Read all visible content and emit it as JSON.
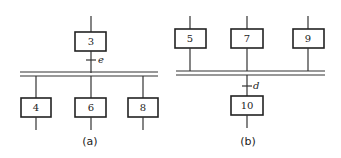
{
  "diagram_a": {
    "caption": "(a)",
    "top_step": "3",
    "transition": "e",
    "bottom_steps": [
      "4",
      "6",
      "8"
    ]
  },
  "diagram_b": {
    "caption": "(b)",
    "top_steps": [
      "5",
      "7",
      "9"
    ],
    "transition": "d",
    "bottom_step": "10"
  }
}
